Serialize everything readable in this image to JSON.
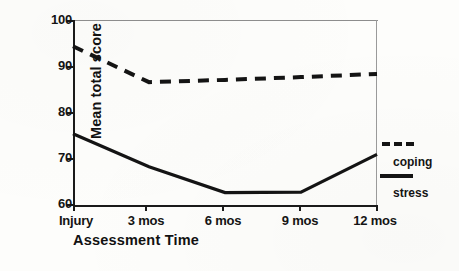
{
  "chart_data": {
    "type": "line",
    "title": "",
    "xlabel": "Assessment Time",
    "ylabel": "Mean total score",
    "categories": [
      "Injury",
      "3 mos",
      "6 mos",
      "9 mos",
      "12 mos"
    ],
    "ylim": [
      60,
      100
    ],
    "yticks": [
      60,
      70,
      80,
      90,
      100
    ],
    "ytick_labels": [
      "60",
      "70",
      "80",
      "90",
      "100"
    ],
    "grid": false,
    "legend_position": "right",
    "series": [
      {
        "name": "coping",
        "style": "dashed",
        "color": "#141414",
        "values": [
          94.5,
          86.7,
          87.2,
          87.8,
          88.5
        ]
      },
      {
        "name": "stress",
        "style": "solid",
        "color": "#141414",
        "values": [
          75.5,
          68.3,
          62.7,
          62.8,
          71.0
        ]
      }
    ]
  },
  "axes": {
    "y_title": "Mean total score",
    "x_title": "Assessment Time",
    "y_tick_labels": [
      "100",
      "90",
      "80",
      "70",
      "60"
    ],
    "x_tick_labels": [
      "Injury",
      "3 mos",
      "6 mos",
      "9 mos",
      "12 mos"
    ]
  },
  "legend": {
    "items": [
      {
        "label": "coping",
        "style": "dashed"
      },
      {
        "label": "stress",
        "style": "solid"
      }
    ],
    "coping_label": "coping",
    "stress_label": "stress"
  }
}
